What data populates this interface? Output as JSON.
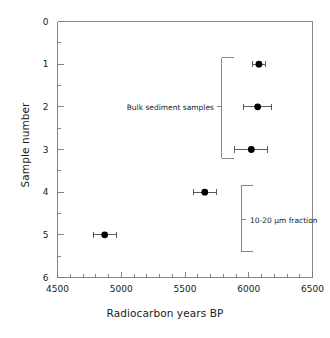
{
  "chart_data": {
    "type": "scatter",
    "title": "",
    "xlabel": "Radiocarbon years BP",
    "ylabel": "Sample number",
    "xlim": [
      4500,
      6500
    ],
    "ylim": [
      0,
      6
    ],
    "y_inverted": true,
    "grid": false,
    "legend": "none",
    "xticks": [
      4500,
      5000,
      5500,
      6000,
      6500
    ],
    "xtick_labels": [
      "4500",
      "5000",
      "5500",
      "6000",
      "6500"
    ],
    "x_minor_tick_step": 100,
    "yticks": [
      0,
      1,
      2,
      3,
      4,
      5,
      6
    ],
    "ytick_labels": [
      "0",
      "1",
      "2",
      "3",
      "4",
      "5",
      "6"
    ],
    "y_minor_tick_step": 0.5,
    "marker": "filled-circle",
    "marker_color": "#000000",
    "errorbar_orientation": "horizontal",
    "points": [
      {
        "sample": 1,
        "x": 6080,
        "xerr": 50,
        "group": "Bulk sediment samples"
      },
      {
        "sample": 2,
        "x": 6070,
        "xerr": 110,
        "group": "Bulk sediment samples"
      },
      {
        "sample": 3,
        "x": 6020,
        "xerr": 130,
        "group": "Bulk sediment samples"
      },
      {
        "sample": 4,
        "x": 5655,
        "xerr": 90,
        "group": "10-20 µm fraction"
      },
      {
        "sample": 5,
        "x": 4870,
        "xerr": 90,
        "group": "10-20 µm fraction"
      }
    ],
    "annotations": [
      {
        "id": "bulk",
        "text": "Bulk sediment samples",
        "bracket_y_start": 0.85,
        "bracket_y_end": 3.2,
        "bracket_x": 5790,
        "label_y": 2.0,
        "label_side": "left"
      },
      {
        "id": "fraction",
        "text": "10-20 µm fraction",
        "bracket_y_start": 3.85,
        "bracket_y_end": 5.4,
        "bracket_x": 5940,
        "label_y": 4.65,
        "label_side": "right"
      }
    ]
  },
  "axes": {
    "xlabel": "Radiocarbon years BP",
    "ylabel": "Sample number"
  }
}
